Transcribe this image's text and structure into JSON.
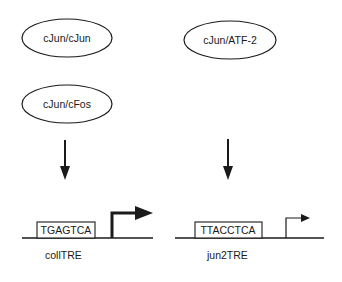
{
  "diagram": {
    "complexes": [
      {
        "label": "cJun/cJun",
        "cx": 67,
        "cy": 38,
        "rx": 45,
        "ry": 19
      },
      {
        "label": "cJun/cFos",
        "cx": 67,
        "cy": 104,
        "rx": 45,
        "ry": 19
      },
      {
        "label": "cJun/ATF-2",
        "cx": 230,
        "cy": 40,
        "rx": 46,
        "ry": 19
      }
    ],
    "elements": [
      {
        "sequence": "TGAGTCA",
        "name": "collTRE",
        "promoter_strength": "strong"
      },
      {
        "sequence": "TTACCTCA",
        "name": "jun2TRE",
        "promoter_strength": "weak"
      }
    ],
    "colors": {
      "stroke": "#1a1a1a",
      "background": "#ffffff"
    }
  }
}
